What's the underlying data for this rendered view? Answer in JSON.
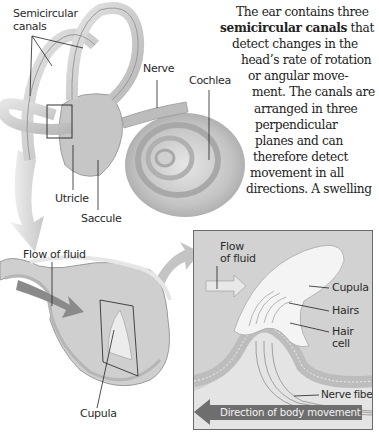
{
  "figure": {
    "colors": {
      "background": "#ffffff",
      "illustration_gray": "#c8c8c8",
      "inset_background": "#d2d2d2",
      "banner": "#6e6e6e",
      "text": "#222222"
    }
  },
  "body_text": {
    "lines": [
      "The ear contains three",
      "semicircular canals",
      " that",
      "detect changes in the",
      "head’s rate of rotation",
      "or angular move-",
      "ment. The canals are",
      "arranged in three",
      "perpendicular",
      "planes and can",
      "therefore detect",
      "movement in all",
      "directions. A swelling"
    ]
  },
  "ear_labels": {
    "semicircular_canals_1": "Semicircular",
    "semicircular_canals_2": "canals",
    "nerve": "Nerve",
    "cochlea": "Cochlea",
    "utricle": "Utricle",
    "saccule": "Saccule"
  },
  "canal_section_labels": {
    "flow_of_fluid": "Flow of fluid",
    "cupula": "Cupula"
  },
  "inset_labels": {
    "flow_1": "Flow",
    "flow_2": "of fluid",
    "cupula": "Cupula",
    "hairs": "Hairs",
    "hair_cell_1": "Hair",
    "hair_cell_2": "cell",
    "nerve_fibers": "Nerve fibers",
    "direction": "Direction of body movement"
  }
}
